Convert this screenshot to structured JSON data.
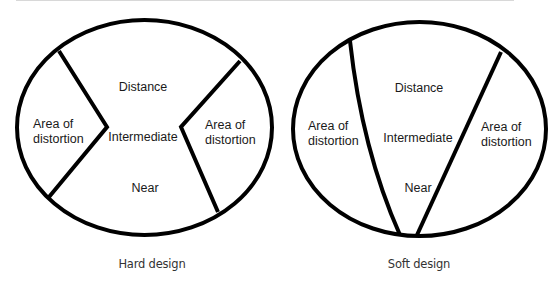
{
  "figures": [
    {
      "id": "hard",
      "caption": "Hard design",
      "regions": {
        "distance": "Distance",
        "intermediate": "Intermediate",
        "near": "Near",
        "left_distortion_line1": "Area of",
        "left_distortion_line2": "distortion",
        "right_distortion_line1": "Area of",
        "right_distortion_line2": "distortion"
      }
    },
    {
      "id": "soft",
      "caption": "Soft design",
      "regions": {
        "distance": "Distance",
        "intermediate": "Intermediate",
        "near": "Near",
        "left_distortion_line1": "Area of",
        "left_distortion_line2": "distortion",
        "right_distortion_line1": "Area of",
        "right_distortion_line2": "distortion"
      }
    }
  ],
  "colors": {
    "stroke": "#000000",
    "text": "#1a1a1a",
    "caption": "#333333",
    "background": "#ffffff"
  }
}
